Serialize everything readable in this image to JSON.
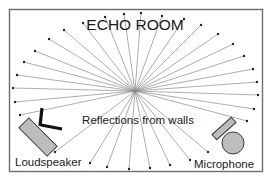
{
  "diagram": {
    "title": "ECHO ROOM",
    "center_label": "Reflections from walls",
    "source_label": "Loudspeaker",
    "receiver_label": "Microphone",
    "colors": {
      "border": "#6e6e6e",
      "ray": "#8a8a8a",
      "device_fill": "#bdbdbd",
      "device_stroke": "#3a3a3a",
      "stand": "#111111",
      "background": "#ffffff"
    },
    "center": [
      135,
      91
    ],
    "ray_endpoints": [
      [
        20,
        115
      ],
      [
        15,
        102
      ],
      [
        13,
        88
      ],
      [
        17,
        75
      ],
      [
        24,
        62
      ],
      [
        35,
        51
      ],
      [
        49,
        39
      ],
      [
        64,
        30
      ],
      [
        83,
        23
      ],
      [
        105,
        17
      ],
      [
        124,
        14
      ],
      [
        141,
        13
      ],
      [
        162,
        16
      ],
      [
        184,
        19
      ],
      [
        201,
        25
      ],
      [
        218,
        34
      ],
      [
        233,
        44
      ],
      [
        244,
        56
      ],
      [
        253,
        69
      ],
      [
        257,
        82
      ],
      [
        258,
        95
      ],
      [
        254,
        109
      ],
      [
        247,
        121
      ],
      [
        55,
        152
      ],
      [
        90,
        163
      ],
      [
        107,
        167
      ],
      [
        129,
        169
      ],
      [
        150,
        168
      ],
      [
        170,
        165
      ],
      [
        190,
        160
      ],
      [
        208,
        152
      ]
    ]
  }
}
